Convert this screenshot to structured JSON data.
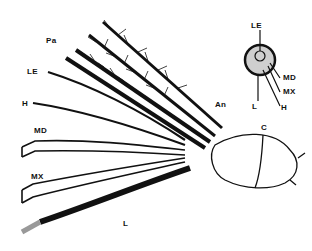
{
  "diagram": {
    "main_labels": [
      {
        "id": "pa",
        "text": "Pa",
        "x": 46,
        "y": 37
      },
      {
        "id": "le",
        "text": "LE",
        "x": 27,
        "y": 68
      },
      {
        "id": "h",
        "text": "H",
        "x": 22,
        "y": 100
      },
      {
        "id": "md",
        "text": "MD",
        "x": 34,
        "y": 127
      },
      {
        "id": "mx",
        "text": "MX",
        "x": 31,
        "y": 173
      },
      {
        "id": "an",
        "text": "An",
        "x": 215,
        "y": 101
      },
      {
        "id": "c",
        "text": "C",
        "x": 261,
        "y": 124
      },
      {
        "id": "l",
        "text": "L",
        "x": 123,
        "y": 220
      }
    ],
    "inset_labels": [
      {
        "id": "inset-le",
        "text": "LE",
        "x": 251,
        "y": 24
      },
      {
        "id": "inset-md",
        "text": "MD",
        "x": 283,
        "y": 76
      },
      {
        "id": "inset-mx",
        "text": "MX",
        "x": 283,
        "y": 90
      },
      {
        "id": "inset-l",
        "text": "L",
        "x": 252,
        "y": 103
      },
      {
        "id": "inset-h",
        "text": "H",
        "x": 281,
        "y": 104
      }
    ],
    "colors": {
      "ink": "#111111",
      "stipple": "#9a9a9a",
      "background": "#ffffff"
    }
  }
}
